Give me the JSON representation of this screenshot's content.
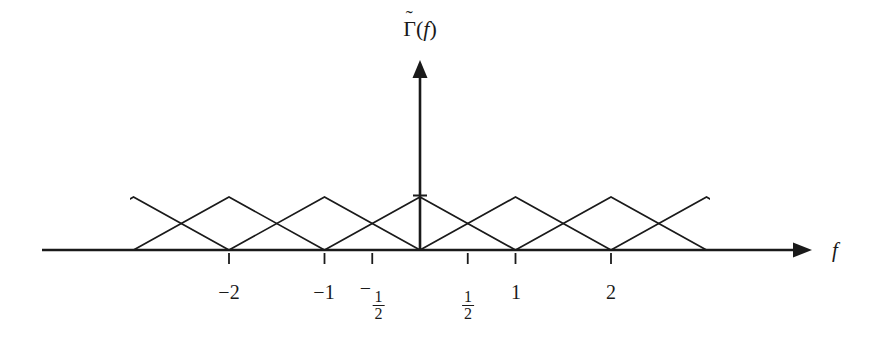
{
  "figure": {
    "title_visible": false,
    "background_color": "#ffffff",
    "line_color": "#1a1a1a",
    "y_axis_label": {
      "symbol": "Γ",
      "accent": "˜",
      "argument": "f",
      "open_paren": "(",
      "close_paren": ")",
      "full_text": "Γ̃(f)"
    },
    "x_axis_label": "f"
  },
  "chart_data": {
    "type": "line",
    "title": "",
    "subtitle": "",
    "xlabel": "f",
    "ylabel": "Γ̃(f)",
    "grid": false,
    "legend": false,
    "legend_position": "none",
    "xlim": [
      -3.95,
      4.0
    ],
    "ylim": [
      0,
      1.18
    ],
    "x_axis_visible_from_px": 42,
    "x_axis_visible_to_px": 800,
    "baseline_y_px": 250,
    "peak_y_px": 197,
    "origin_x_px": 420,
    "unit_px": 95.5,
    "y_axis_arrow_tip_px": 66,
    "peak_tick_half_width_px": 7,
    "tick_length_px": 11,
    "tick_gap_px": 3,
    "x_ticks": [
      {
        "value": -2,
        "label": "−2",
        "kind": "integer",
        "label_x_px": 229,
        "label_y_px": 282
      },
      {
        "value": -1,
        "label": "−1",
        "kind": "integer",
        "label_x_px": 324,
        "label_y_px": 282
      },
      {
        "value": -0.5,
        "label": "-1/2",
        "kind": "fraction",
        "label_x_px": 372,
        "label_y_px": 278,
        "sign": "−",
        "numerator": "1",
        "denominator": "2"
      },
      {
        "value": 0.5,
        "label": "1/2",
        "kind": "fraction",
        "label_x_px": 468,
        "label_y_px": 278,
        "sign": "",
        "numerator": "1",
        "denominator": "2"
      },
      {
        "value": 1,
        "label": "1",
        "kind": "integer",
        "label_x_px": 516,
        "label_y_px": 282
      },
      {
        "value": 2,
        "label": "2",
        "kind": "integer",
        "label_x_px": 611,
        "label_y_px": 282
      }
    ],
    "series": [
      {
        "name": "periodic triangular spectrum",
        "shape": "triangle",
        "peak_value": 1,
        "half_base_width": 1,
        "centers": [
          -3,
          -2,
          -1,
          0,
          1,
          2,
          3
        ],
        "points_per_triangle": [
          {
            "x": -4,
            "y": 0
          },
          {
            "x": -3,
            "y": 1
          },
          {
            "x": -2,
            "y": 0
          },
          {
            "x": -2,
            "y": 0
          },
          {
            "x": -2,
            "y": 1
          },
          {
            "x": -1,
            "y": 0
          },
          {
            "x": -1,
            "y": 1
          },
          {
            "x": 0,
            "y": 0
          },
          {
            "x": 0,
            "y": 1
          },
          {
            "x": 1,
            "y": 0
          },
          {
            "x": 1,
            "y": 1
          },
          {
            "x": 2,
            "y": 0
          },
          {
            "x": 2,
            "y": 1
          },
          {
            "x": 3,
            "y": 1
          },
          {
            "x": 4,
            "y": 0
          }
        ]
      }
    ],
    "y_axis": {
      "visible": true,
      "arrow": true,
      "ticks": [
        {
          "value": 1,
          "label": "",
          "kind": "unlabeled-peak-tick"
        }
      ]
    }
  }
}
